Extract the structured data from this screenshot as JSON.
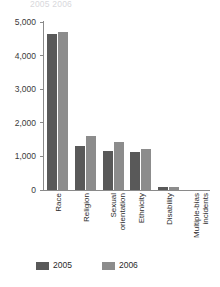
{
  "figure": {
    "title_sliver": "2005   2006",
    "background": "#ffffff"
  },
  "legend": {
    "position": "bottom-left",
    "items": [
      {
        "label": "2005",
        "color": "#595959"
      },
      {
        "label": "2006",
        "color": "#8c8c8c"
      }
    ]
  },
  "axis": {
    "y_ticks": [
      "5,000",
      "4,000",
      "3,000",
      "2,000",
      "1,000",
      "0"
    ],
    "y_tick_values": [
      5000,
      4000,
      3000,
      2000,
      1000,
      0
    ]
  },
  "chart_data": {
    "type": "bar",
    "title": "",
    "subtitle": "",
    "xlabel": "",
    "ylabel": "",
    "ylim": [
      0,
      5000
    ],
    "grid": false,
    "legend_position": "bottom-left",
    "categories": [
      "Race",
      "Religion",
      "Sexual orientation",
      "Ethnicity",
      "Disability",
      "Multiple-bias incidents"
    ],
    "series": [
      {
        "name": "2005",
        "color": "#595959",
        "values": [
          4650,
          1300,
          1170,
          1140,
          80,
          0
        ]
      },
      {
        "name": "2006",
        "color": "#8c8c8c",
        "values": [
          4700,
          1600,
          1415,
          1230,
          90,
          0
        ]
      }
    ]
  }
}
